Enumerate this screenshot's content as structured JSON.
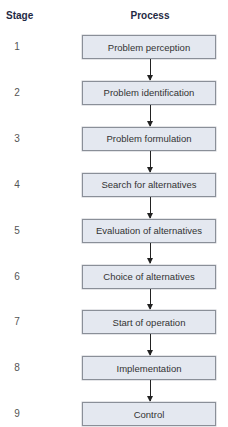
{
  "headers": {
    "stage": "Stage",
    "process": "Process"
  },
  "steps": [
    {
      "stage": "1",
      "label": "Problem perception"
    },
    {
      "stage": "2",
      "label": "Problem identification"
    },
    {
      "stage": "3",
      "label": "Problem formulation"
    },
    {
      "stage": "4",
      "label": "Search for alternatives"
    },
    {
      "stage": "5",
      "label": "Evaluation of alternatives"
    },
    {
      "stage": "6",
      "label": "Choice of alternatives"
    },
    {
      "stage": "7",
      "label": "Start of operation"
    },
    {
      "stage": "8",
      "label": "Implementation"
    },
    {
      "stage": "9",
      "label": "Control"
    }
  ],
  "colors": {
    "box_fill": "#e4e8f0",
    "box_border": "#8a8f98",
    "header_text": "#1f2a44",
    "arrow": "#222222"
  }
}
